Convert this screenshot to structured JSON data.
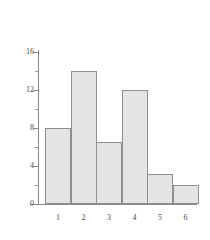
{
  "chart_data": {
    "type": "bar",
    "title": "",
    "subtitle": "",
    "xlabel": "",
    "ylabel": "",
    "categories": [
      "1",
      "2",
      "3",
      "4",
      "5",
      "6"
    ],
    "values": [
      8,
      14,
      6.5,
      12,
      3.2,
      2
    ],
    "series": [
      {
        "name": "frequency",
        "values": [
          8,
          14,
          6.5,
          12,
          3.2,
          2
        ]
      }
    ],
    "ylim": [
      0,
      16
    ],
    "xlim": [
      0.5,
      6.5
    ],
    "y_ticks_major": [
      0,
      4,
      8,
      12,
      16
    ],
    "y_tick_labels": [
      "0",
      "4",
      "8",
      "12",
      "16"
    ],
    "y_ticks_minor": [
      2,
      6,
      10,
      14
    ],
    "x_tick_labels": [
      "1",
      "2",
      "3",
      "4",
      "5",
      "6"
    ],
    "grid": false,
    "legend": null,
    "legend_position": "none",
    "annotations": [],
    "bar_style": "adjacent-histogram",
    "colors": {
      "bar_fill": "#e4e4e4",
      "bar_border": "#8f8f8f",
      "axis": "#8a8a8a",
      "tick_label": "#4a4a4a",
      "background": "#ffffff"
    }
  }
}
